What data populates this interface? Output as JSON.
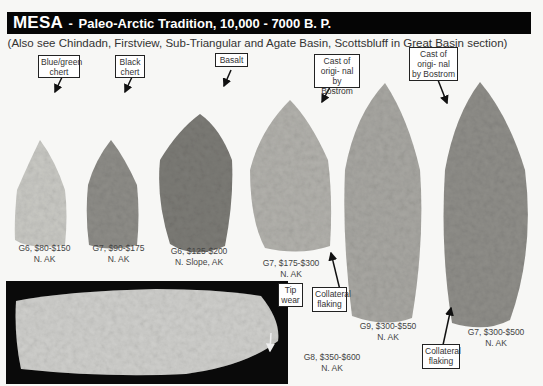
{
  "header": {
    "type_name": "MESA",
    "separator": " - ",
    "tradition": "Paleo-Arctic Tradition, 10,000 - 7000 B. P."
  },
  "subtitle": "(Also see Chindadn, Firstview, Sub-Triangular and Agate Basin, Scottsbluff in Great Basin section)",
  "callouts": [
    {
      "id": "blue-green-chert",
      "text": "Blue/green chert"
    },
    {
      "id": "black-chert",
      "text": "Black chert"
    },
    {
      "id": "basalt",
      "text": "Basalt"
    },
    {
      "id": "cast-1",
      "text": "Cast of origi- nal by Bostrom"
    },
    {
      "id": "cast-2",
      "text": "Cast of origi- nal by Bostrom"
    },
    {
      "id": "collateral-1",
      "text": "Collateral flaking"
    },
    {
      "id": "collateral-2",
      "text": "Collateral flaking"
    },
    {
      "id": "tip-wear",
      "text": "Tip wear"
    }
  ],
  "points": [
    {
      "grade": "G6, $80-$150",
      "location": "N. AK",
      "material": "Blue/green chert"
    },
    {
      "grade": "G7, $90-$175",
      "location": "N. AK",
      "material": "Black chert"
    },
    {
      "grade": "G6, $125-$200",
      "location": "N. Slope, AK",
      "material": "Basalt"
    },
    {
      "grade": "G7, $175-$300",
      "location": "N. AK",
      "material": "Cast of original by Bostrom"
    },
    {
      "grade": "G9, $300-$550",
      "location": "N. AK",
      "material": ""
    },
    {
      "grade": "G7, $300-$500",
      "location": "N. AK",
      "material": "Cast of original by Bostrom"
    },
    {
      "grade": "G8, $350-$600",
      "location": "N. AK",
      "material": ""
    }
  ]
}
